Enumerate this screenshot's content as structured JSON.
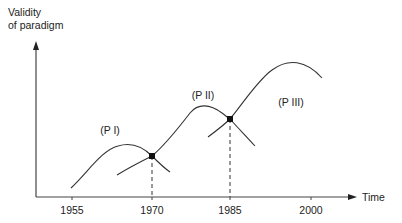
{
  "diagram": {
    "y_axis_label_line1": "Validity",
    "y_axis_label_line2": "of paradigm",
    "x_axis_label": "Time",
    "ticks": [
      {
        "label": "1955",
        "x": 72
      },
      {
        "label": "1970",
        "x": 152
      },
      {
        "label": "1985",
        "x": 230
      },
      {
        "label": "2000",
        "x": 311
      }
    ],
    "paradigms": [
      {
        "label": "(P I)",
        "x": 110,
        "y": 124
      },
      {
        "label": "(P II)",
        "x": 203,
        "y": 89
      },
      {
        "label": "(P III)",
        "x": 291,
        "y": 96
      }
    ],
    "transition_points": [
      {
        "year": "1970",
        "x": 152,
        "y": 156
      },
      {
        "year": "1985",
        "x": 230,
        "y": 119
      }
    ],
    "line_color": "#333333"
  }
}
